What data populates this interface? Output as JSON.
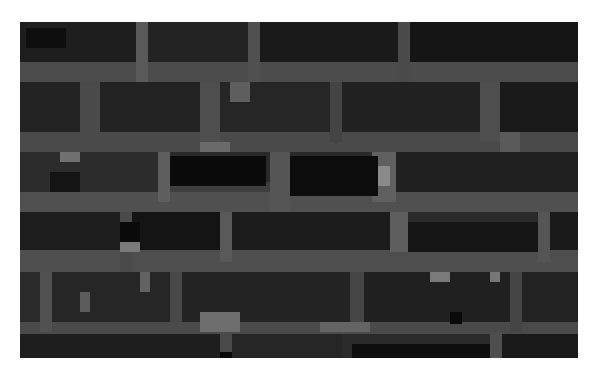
{
  "image": {
    "description": "Pixelated (mosaic) grayscale photograph of a brick wall",
    "frame": {
      "x": 20,
      "y": 22,
      "w": 558,
      "h": 336
    },
    "base_color": "#2a2a2a",
    "block_size": 10
  },
  "layers": {
    "mortar": [
      {
        "x": 0,
        "y": 40,
        "w": 558,
        "h": 20,
        "c": "#4c4c4c"
      },
      {
        "x": 0,
        "y": 110,
        "w": 558,
        "h": 20,
        "c": "#4a4a4a"
      },
      {
        "x": 0,
        "y": 160,
        "w": 558,
        "h": 10,
        "c": "#3e3e3e"
      },
      {
        "x": 0,
        "y": 170,
        "w": 558,
        "h": 20,
        "c": "#505050"
      },
      {
        "x": 0,
        "y": 228,
        "w": 558,
        "h": 22,
        "c": "#4e4e4e"
      },
      {
        "x": 0,
        "y": 300,
        "w": 558,
        "h": 12,
        "c": "#4a4a4a"
      },
      {
        "x": 116,
        "y": 0,
        "w": 12,
        "h": 60,
        "c": "#5a5a5a"
      },
      {
        "x": 228,
        "y": 0,
        "w": 12,
        "h": 60,
        "c": "#505050"
      },
      {
        "x": 378,
        "y": 0,
        "w": 12,
        "h": 60,
        "c": "#4a4a4a"
      },
      {
        "x": 60,
        "y": 60,
        "w": 20,
        "h": 60,
        "c": "#4a4a4a"
      },
      {
        "x": 180,
        "y": 60,
        "w": 20,
        "h": 70,
        "c": "#4e4e4e"
      },
      {
        "x": 310,
        "y": 60,
        "w": 12,
        "h": 60,
        "c": "#444444"
      },
      {
        "x": 460,
        "y": 60,
        "w": 20,
        "h": 60,
        "c": "#4e4e4e"
      },
      {
        "x": 138,
        "y": 130,
        "w": 12,
        "h": 50,
        "c": "#5e5e5e"
      },
      {
        "x": 250,
        "y": 130,
        "w": 20,
        "h": 60,
        "c": "#555555"
      },
      {
        "x": 352,
        "y": 130,
        "w": 24,
        "h": 50,
        "c": "#606060"
      },
      {
        "x": 100,
        "y": 190,
        "w": 12,
        "h": 60,
        "c": "#4a4a4a"
      },
      {
        "x": 200,
        "y": 190,
        "w": 12,
        "h": 50,
        "c": "#595959"
      },
      {
        "x": 370,
        "y": 190,
        "w": 18,
        "h": 40,
        "c": "#5e5e5e"
      },
      {
        "x": 518,
        "y": 190,
        "w": 12,
        "h": 50,
        "c": "#555555"
      },
      {
        "x": 20,
        "y": 250,
        "w": 12,
        "h": 60,
        "c": "#515151"
      },
      {
        "x": 150,
        "y": 250,
        "w": 12,
        "h": 50,
        "c": "#484848"
      },
      {
        "x": 330,
        "y": 250,
        "w": 14,
        "h": 60,
        "c": "#464646"
      },
      {
        "x": 490,
        "y": 250,
        "w": 12,
        "h": 60,
        "c": "#454545"
      },
      {
        "x": 200,
        "y": 310,
        "w": 12,
        "h": 26,
        "c": "#4a4a4a"
      },
      {
        "x": 470,
        "y": 310,
        "w": 12,
        "h": 26,
        "c": "#4e4e4e"
      }
    ],
    "bricks": [
      {
        "x": 0,
        "y": 0,
        "w": 116,
        "h": 40,
        "c": "#1e1e1e"
      },
      {
        "x": 128,
        "y": 0,
        "w": 100,
        "h": 40,
        "c": "#232323"
      },
      {
        "x": 240,
        "y": 0,
        "w": 138,
        "h": 40,
        "c": "#1a1a1a"
      },
      {
        "x": 390,
        "y": 0,
        "w": 168,
        "h": 40,
        "c": "#151515"
      },
      {
        "x": 0,
        "y": 60,
        "w": 60,
        "h": 50,
        "c": "#232323"
      },
      {
        "x": 80,
        "y": 60,
        "w": 100,
        "h": 50,
        "c": "#222222"
      },
      {
        "x": 200,
        "y": 60,
        "w": 110,
        "h": 50,
        "c": "#262626"
      },
      {
        "x": 322,
        "y": 60,
        "w": 138,
        "h": 50,
        "c": "#212121"
      },
      {
        "x": 480,
        "y": 60,
        "w": 78,
        "h": 50,
        "c": "#1a1a1a"
      },
      {
        "x": 0,
        "y": 130,
        "w": 138,
        "h": 40,
        "c": "#2c2c2c"
      },
      {
        "x": 150,
        "y": 134,
        "w": 96,
        "h": 30,
        "c": "#0a0a0a"
      },
      {
        "x": 270,
        "y": 134,
        "w": 88,
        "h": 40,
        "c": "#0c0c0c"
      },
      {
        "x": 376,
        "y": 130,
        "w": 182,
        "h": 40,
        "c": "#202020"
      },
      {
        "x": 0,
        "y": 190,
        "w": 100,
        "h": 38,
        "c": "#1e1e1e"
      },
      {
        "x": 112,
        "y": 190,
        "w": 88,
        "h": 38,
        "c": "#141414"
      },
      {
        "x": 212,
        "y": 190,
        "w": 158,
        "h": 38,
        "c": "#1c1c1c"
      },
      {
        "x": 388,
        "y": 200,
        "w": 130,
        "h": 30,
        "c": "#161616"
      },
      {
        "x": 530,
        "y": 190,
        "w": 28,
        "h": 38,
        "c": "#1a1a1a"
      },
      {
        "x": 32,
        "y": 250,
        "w": 118,
        "h": 50,
        "c": "#262626"
      },
      {
        "x": 162,
        "y": 250,
        "w": 168,
        "h": 50,
        "c": "#232323"
      },
      {
        "x": 344,
        "y": 250,
        "w": 146,
        "h": 50,
        "c": "#202020"
      },
      {
        "x": 502,
        "y": 250,
        "w": 56,
        "h": 50,
        "c": "#222222"
      },
      {
        "x": 0,
        "y": 312,
        "w": 200,
        "h": 24,
        "c": "#1e1e1e"
      },
      {
        "x": 212,
        "y": 312,
        "w": 110,
        "h": 24,
        "c": "#262626"
      },
      {
        "x": 332,
        "y": 322,
        "w": 138,
        "h": 14,
        "c": "#0e0e0e"
      },
      {
        "x": 482,
        "y": 312,
        "w": 76,
        "h": 24,
        "c": "#1a1a1a"
      }
    ],
    "highlights": [
      {
        "x": 40,
        "y": 130,
        "w": 20,
        "h": 10,
        "c": "#707070"
      },
      {
        "x": 100,
        "y": 220,
        "w": 20,
        "h": 10,
        "c": "#7a7a7a"
      },
      {
        "x": 358,
        "y": 144,
        "w": 12,
        "h": 20,
        "c": "#8a8a8a"
      },
      {
        "x": 180,
        "y": 120,
        "w": 30,
        "h": 10,
        "c": "#6a6a6a"
      },
      {
        "x": 410,
        "y": 250,
        "w": 20,
        "h": 10,
        "c": "#7a7a7a"
      },
      {
        "x": 470,
        "y": 250,
        "w": 10,
        "h": 10,
        "c": "#767676"
      },
      {
        "x": 180,
        "y": 290,
        "w": 40,
        "h": 20,
        "c": "#6e6e6e"
      },
      {
        "x": 300,
        "y": 300,
        "w": 50,
        "h": 10,
        "c": "#646464"
      },
      {
        "x": 210,
        "y": 60,
        "w": 20,
        "h": 20,
        "c": "#5e5e5e"
      },
      {
        "x": 120,
        "y": 250,
        "w": 10,
        "h": 20,
        "c": "#626262"
      },
      {
        "x": 480,
        "y": 110,
        "w": 20,
        "h": 20,
        "c": "#5a5a5a"
      },
      {
        "x": 60,
        "y": 270,
        "w": 10,
        "h": 20,
        "c": "#5c5c5c"
      }
    ],
    "shadows": [
      {
        "x": 100,
        "y": 200,
        "w": 20,
        "h": 20,
        "c": "#0a0a0a"
      },
      {
        "x": 30,
        "y": 150,
        "w": 30,
        "h": 20,
        "c": "#141414"
      },
      {
        "x": 430,
        "y": 290,
        "w": 12,
        "h": 12,
        "c": "#0a0a0a"
      },
      {
        "x": 200,
        "y": 330,
        "w": 12,
        "h": 6,
        "c": "#0a0a0a"
      },
      {
        "x": 6,
        "y": 6,
        "w": 40,
        "h": 20,
        "c": "#0e0e0e"
      }
    ]
  }
}
